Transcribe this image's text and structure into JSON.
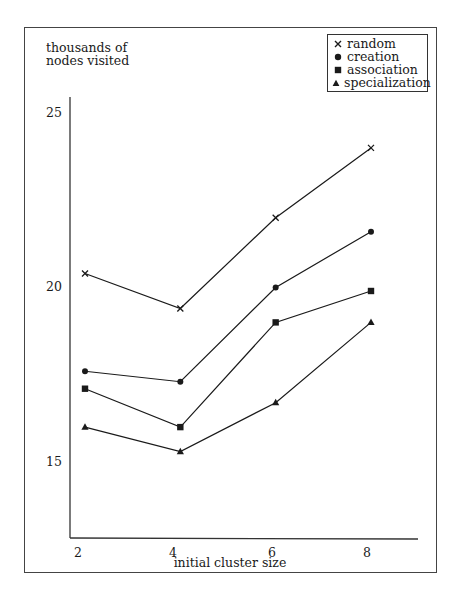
{
  "chart_data": {
    "type": "line",
    "title": "",
    "xlabel": "initial cluster size",
    "ylabel": "thousands of nodes visited",
    "ylabel_lines": [
      "thousands of",
      "nodes visited"
    ],
    "x": [
      2,
      4,
      6,
      8
    ],
    "x_tick_labels": [
      "2",
      "4",
      "6",
      "8"
    ],
    "y_tick_labels": [
      "25",
      "20",
      "15"
    ],
    "y_ticks": [
      25,
      20,
      15
    ],
    "ylim": [
      12.9,
      25.5
    ],
    "grid": false,
    "legend_position": "upper right",
    "series": [
      {
        "name": "random",
        "marker": "x",
        "values": [
          20.4,
          19.4,
          22.0,
          24.0
        ]
      },
      {
        "name": "creation",
        "marker": "circle",
        "values": [
          17.6,
          17.3,
          20.0,
          21.6
        ]
      },
      {
        "name": "association",
        "marker": "square",
        "values": [
          17.1,
          16.0,
          19.0,
          19.9
        ]
      },
      {
        "name": "specialization",
        "marker": "triangle",
        "values": [
          16.0,
          15.3,
          16.7,
          19.0
        ]
      }
    ]
  },
  "legend": {
    "items": [
      {
        "label": "random",
        "symbol": "×"
      },
      {
        "label": "creation",
        "symbol": "●"
      },
      {
        "label": "association",
        "symbol": "■"
      },
      {
        "label": "specialization",
        "symbol": "▲"
      }
    ]
  },
  "colors": {
    "ink": "#1a1a1a",
    "frame": "#444444",
    "background": "#ffffff"
  }
}
